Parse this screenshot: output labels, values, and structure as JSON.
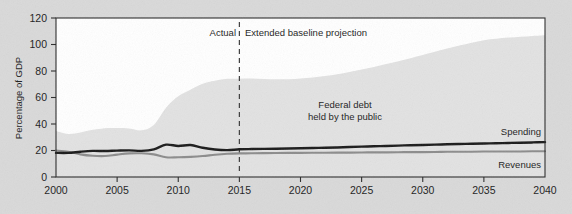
{
  "chart_data": {
    "type": "area",
    "title": "",
    "subtitle": "",
    "xlabel": "",
    "ylabel": "Percentage of GDP",
    "xlim": [
      2000,
      2040
    ],
    "ylim": [
      0,
      120
    ],
    "grid": false,
    "legend_position": "inline-right",
    "x_ticks": [
      "2000",
      "2005",
      "2010",
      "2015",
      "2020",
      "2025",
      "2030",
      "2035",
      "2040"
    ],
    "y_ticks": [
      "0",
      "20",
      "40",
      "60",
      "80",
      "100",
      "120"
    ],
    "x": [
      2000,
      2001,
      2002,
      2003,
      2004,
      2005,
      2006,
      2007,
      2008,
      2009,
      2010,
      2011,
      2012,
      2013,
      2014,
      2015,
      2016,
      2017,
      2018,
      2019,
      2020,
      2021,
      2022,
      2023,
      2024,
      2025,
      2026,
      2027,
      2028,
      2029,
      2030,
      2031,
      2032,
      2033,
      2034,
      2035,
      2036,
      2037,
      2038,
      2039,
      2040
    ],
    "series": [
      {
        "name": "Federal debt held by the public",
        "kind": "area",
        "color": "#e2e2e2",
        "values": [
          34.7,
          32.5,
          33.6,
          35.6,
          36.8,
          36.9,
          36.6,
          35.2,
          39.3,
          52.3,
          60.9,
          65.9,
          70.4,
          72.6,
          74.1,
          74.2,
          74.3,
          74.0,
          73.8,
          73.8,
          74.3,
          75.1,
          76.2,
          77.6,
          79.3,
          81.1,
          83.1,
          85.2,
          87.4,
          89.7,
          92.1,
          94.5,
          96.9,
          99.2,
          101.4,
          103.3,
          104.3,
          105.2,
          105.9,
          106.5,
          107.0
        ]
      },
      {
        "name": "Spending",
        "kind": "line",
        "color": "#1a1a1a",
        "values": [
          18.2,
          18.2,
          19.1,
          19.7,
          19.6,
          19.9,
          20.1,
          19.7,
          20.8,
          24.4,
          23.4,
          24.1,
          22.1,
          20.8,
          20.3,
          20.9,
          21.1,
          21.2,
          21.3,
          21.5,
          21.7,
          21.9,
          22.1,
          22.3,
          22.6,
          22.9,
          23.2,
          23.4,
          23.7,
          24.0,
          24.2,
          24.4,
          24.7,
          24.9,
          25.1,
          25.3,
          25.5,
          25.7,
          25.9,
          26.1,
          26.3
        ]
      },
      {
        "name": "Revenues",
        "kind": "line",
        "color": "#8c8c8c",
        "values": [
          20.0,
          19.1,
          17.1,
          16.0,
          15.8,
          16.9,
          17.8,
          17.9,
          17.1,
          14.9,
          14.9,
          15.2,
          15.8,
          16.8,
          17.5,
          17.8,
          17.9,
          18.0,
          18.1,
          18.2,
          18.2,
          18.3,
          18.3,
          18.4,
          18.4,
          18.5,
          18.6,
          18.6,
          18.7,
          18.8,
          18.8,
          18.9,
          19.0,
          19.0,
          19.1,
          19.2,
          19.2,
          19.3,
          19.3,
          19.4,
          19.4
        ]
      }
    ],
    "annotations": [
      {
        "id": "divider-year",
        "label": "",
        "value": 2015,
        "style": "dashed-vertical"
      },
      {
        "id": "actual-label",
        "label": "Actual"
      },
      {
        "id": "projection-label",
        "label": "Extended baseline projection"
      },
      {
        "id": "debt-label-line1",
        "label": "Federal debt"
      },
      {
        "id": "debt-label-line2",
        "label": "held by the public"
      },
      {
        "id": "spending-label",
        "label": "Spending"
      },
      {
        "id": "revenues-label",
        "label": "Revenues"
      }
    ],
    "colors": {
      "background": "#d9d9d9",
      "plot_background": "#ffffff",
      "area_fill": "#e2e2e2",
      "spending_line": "#1a1a1a",
      "revenues_line": "#8c8c8c",
      "axis": "#2b2b2b",
      "text": "#1c1c1c"
    }
  }
}
